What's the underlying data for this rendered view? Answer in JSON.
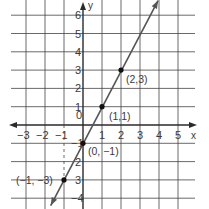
{
  "chart_data": {
    "type": "line",
    "title": "",
    "xlabel": "x",
    "ylabel": "y",
    "xlim": [
      -3.5,
      5.5
    ],
    "ylim": [
      -4.5,
      6.5
    ],
    "grid": true,
    "x_ticks": [
      -3,
      -2,
      -1,
      0,
      1,
      2,
      3,
      4,
      5
    ],
    "y_ticks": [
      -4,
      -3,
      -2,
      -1,
      1,
      2,
      3,
      4,
      5,
      6
    ],
    "x_tick_labels": [
      "−3",
      "−2",
      "−1",
      "0",
      "1",
      "2",
      "3",
      "4",
      "5"
    ],
    "y_tick_labels": [
      "−4",
      "3",
      "2",
      "−1",
      "1",
      "2",
      "3",
      "4",
      "5",
      "6"
    ],
    "series": [
      {
        "name": "y = 2x − 1",
        "line_endpoints": [
          [
            -1.7,
            -4.4
          ],
          [
            3.95,
            6.8
          ]
        ],
        "points": [
          {
            "x": -1,
            "y": -3,
            "label": "(−1, −3)"
          },
          {
            "x": 0,
            "y": -1,
            "label": "(0, −1)"
          },
          {
            "x": 1,
            "y": 1,
            "label": "(1,1)"
          },
          {
            "x": 2,
            "y": 3,
            "label": "(2,3)"
          }
        ]
      }
    ],
    "annotations": [
      {
        "type": "dashed-guide",
        "from": [
          -1,
          0
        ],
        "to": [
          -1,
          -3
        ]
      }
    ]
  },
  "colors": {
    "grid": "#444444",
    "axis": "#2a2a2a",
    "line": "#555555",
    "point": "#111111",
    "text": "#3a3a3a"
  }
}
